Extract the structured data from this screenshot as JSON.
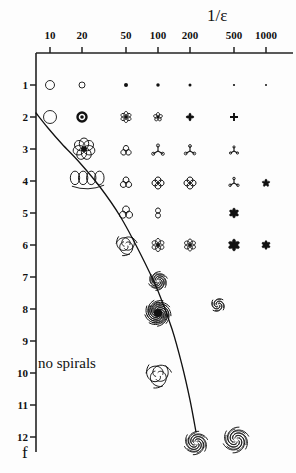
{
  "figure": {
    "title": "1/ε",
    "y_axis_name": "f",
    "region_label": "no spirals"
  },
  "chart_data": {
    "type": "scatter",
    "title": "1/ε",
    "xlabel": "1/ε",
    "ylabel": "f",
    "xscale": "log",
    "grid": false,
    "legend": null,
    "annotations": [
      "no spirals"
    ],
    "x_ticks": [
      {
        "label": "10",
        "px": 50
      },
      {
        "label": "20",
        "px": 82
      },
      {
        "label": "50",
        "px": 126
      },
      {
        "label": "100",
        "px": 158
      },
      {
        "label": "200",
        "px": 190
      },
      {
        "label": "500",
        "px": 234
      },
      {
        "label": "1000",
        "px": 266
      }
    ],
    "y_ticks": [
      {
        "label": "1",
        "px": 85
      },
      {
        "label": "2",
        "px": 117
      },
      {
        "label": "3",
        "px": 149
      },
      {
        "label": "4",
        "px": 181
      },
      {
        "label": "5",
        "px": 213
      },
      {
        "label": "6",
        "px": 245
      },
      {
        "label": "7",
        "px": 277
      },
      {
        "label": "8",
        "px": 309
      },
      {
        "label": "9",
        "px": 341
      },
      {
        "label": "10",
        "px": 373
      },
      {
        "label": "11",
        "px": 405
      },
      {
        "label": "12",
        "px": 437
      }
    ],
    "boundary_curve": {
      "description": "no-spirals separatrix",
      "points": [
        [
          36,
          113
        ],
        [
          48,
          128
        ],
        [
          62,
          144
        ],
        [
          80,
          163
        ],
        [
          100,
          187
        ],
        [
          120,
          216
        ],
        [
          140,
          253
        ],
        [
          158,
          291
        ],
        [
          172,
          329
        ],
        [
          182,
          365
        ],
        [
          190,
          400
        ],
        [
          196,
          432
        ]
      ]
    },
    "cells": [
      {
        "x": "10",
        "f": 1,
        "symbol": "open-circle",
        "size": 9,
        "cx": 50,
        "cy": 85
      },
      {
        "x": "20",
        "f": 1,
        "symbol": "open-circle",
        "size": 6,
        "cx": 82,
        "cy": 85
      },
      {
        "x": "50",
        "f": 1,
        "symbol": "dot",
        "size": 4,
        "cx": 126,
        "cy": 85
      },
      {
        "x": "100",
        "f": 1,
        "symbol": "dot",
        "size": 3.5,
        "cx": 158,
        "cy": 85
      },
      {
        "x": "200",
        "f": 1,
        "symbol": "dot",
        "size": 3,
        "cx": 190,
        "cy": 85
      },
      {
        "x": "500",
        "f": 1,
        "symbol": "dot",
        "size": 2.2,
        "cx": 234,
        "cy": 85
      },
      {
        "x": "1000",
        "f": 1,
        "symbol": "dot",
        "size": 2,
        "cx": 266,
        "cy": 85
      },
      {
        "x": "10",
        "f": 2,
        "symbol": "open-circle",
        "size": 13,
        "cx": 50,
        "cy": 117
      },
      {
        "x": "20",
        "f": 2,
        "symbol": "ring-thick",
        "size": 9,
        "cx": 82,
        "cy": 117
      },
      {
        "x": "50",
        "f": 2,
        "symbol": "rosette-6",
        "size": 11,
        "cx": 126,
        "cy": 117
      },
      {
        "x": "100",
        "f": 2,
        "symbol": "rosette-5",
        "size": 9,
        "cx": 158,
        "cy": 117
      },
      {
        "x": "200",
        "f": 2,
        "symbol": "star-4",
        "size": 8,
        "cx": 190,
        "cy": 117
      },
      {
        "x": "500",
        "f": 2,
        "symbol": "plus",
        "size": 8,
        "cx": 234,
        "cy": 117
      },
      {
        "x": "20",
        "f": 3,
        "symbol": "petal-cluster-7",
        "size": 22,
        "cx": 84,
        "cy": 149
      },
      {
        "x": "50",
        "f": 3,
        "symbol": "petal-3",
        "size": 11,
        "cx": 126,
        "cy": 151
      },
      {
        "x": "100",
        "f": 3,
        "symbol": "tripod",
        "size": 11,
        "cx": 158,
        "cy": 151
      },
      {
        "x": "200",
        "f": 3,
        "symbol": "tripod",
        "size": 10,
        "cx": 190,
        "cy": 151
      },
      {
        "x": "500",
        "f": 3,
        "symbol": "tripod-small",
        "size": 8,
        "cx": 234,
        "cy": 151
      },
      {
        "x": "20",
        "f": 4,
        "symbol": "loop-row-4",
        "size": 26,
        "cx": 88,
        "cy": 181
      },
      {
        "x": "50",
        "f": 4,
        "symbol": "petal-3",
        "size": 12,
        "cx": 126,
        "cy": 183
      },
      {
        "x": "100",
        "f": 4,
        "symbol": "petal-4-curl",
        "size": 12,
        "cx": 158,
        "cy": 183
      },
      {
        "x": "200",
        "f": 4,
        "symbol": "petal-4-curl",
        "size": 12,
        "cx": 190,
        "cy": 183
      },
      {
        "x": "500",
        "f": 4,
        "symbol": "tripod-small",
        "size": 9,
        "cx": 234,
        "cy": 183
      },
      {
        "x": "1000",
        "f": 4,
        "symbol": "star-5-small",
        "size": 8,
        "cx": 266,
        "cy": 183
      },
      {
        "x": "50",
        "f": 5,
        "symbol": "petal-3",
        "size": 14,
        "cx": 126,
        "cy": 213
      },
      {
        "x": "100",
        "f": 5,
        "symbol": "petal-2",
        "size": 10,
        "cx": 158,
        "cy": 213
      },
      {
        "x": "500",
        "f": 5,
        "symbol": "star-6-filled",
        "size": 10,
        "cx": 234,
        "cy": 213
      },
      {
        "x": "50",
        "f": 6,
        "symbol": "spiral-3-large",
        "size": 18,
        "cx": 126,
        "cy": 245
      },
      {
        "x": "100",
        "f": 6,
        "symbol": "rosette-6",
        "size": 13,
        "cx": 158,
        "cy": 245
      },
      {
        "x": "200",
        "f": 6,
        "symbol": "rosette-6",
        "size": 12,
        "cx": 190,
        "cy": 245
      },
      {
        "x": "500",
        "f": 6,
        "symbol": "star-6-filled",
        "size": 12,
        "cx": 234,
        "cy": 245
      },
      {
        "x": "1000",
        "f": 6,
        "symbol": "star-6-filled",
        "size": 9,
        "cx": 266,
        "cy": 245
      },
      {
        "x": "100",
        "f": 7,
        "symbol": "spiral-cluster",
        "size": 16,
        "cx": 158,
        "cy": 281
      },
      {
        "x": "100",
        "f": 8,
        "symbol": "spiral-dense",
        "size": 24,
        "cx": 158,
        "cy": 313
      },
      {
        "x": "200",
        "f": 8,
        "symbol": "spiral-small",
        "size": 12,
        "cx": 218,
        "cy": 305
      },
      {
        "x": "100",
        "f": 10,
        "symbol": "spiral-3-open",
        "size": 22,
        "cx": 158,
        "cy": 375
      },
      {
        "x": "200",
        "f": 12,
        "symbol": "spiral-loose",
        "size": 20,
        "cx": 196,
        "cy": 443
      },
      {
        "x": "200",
        "f": 12,
        "symbol": "spiral-loose-2",
        "size": 22,
        "cx": 236,
        "cy": 440
      }
    ]
  }
}
